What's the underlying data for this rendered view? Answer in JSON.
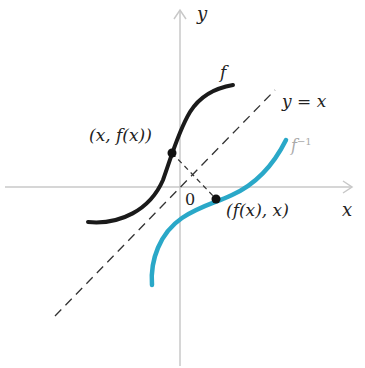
{
  "diagram": {
    "axes": {
      "x_label": "x",
      "y_label": "y",
      "origin_label": "0"
    },
    "curves": [
      {
        "name": "f",
        "label": "f",
        "color": "#1a1a1a"
      },
      {
        "name": "f-inverse",
        "label": "f⁻¹",
        "color": "#2aa8c8"
      },
      {
        "name": "line-y-equals-x",
        "label": "y = x",
        "style": "dashed",
        "color": "#333333"
      }
    ],
    "points": [
      {
        "label": "(x, f(x))",
        "on": "f"
      },
      {
        "label": "(f(x), x)",
        "on": "f-inverse"
      }
    ],
    "connector": "dashed segment joining (x, f(x)) and (f(x), x), perpendicular to y = x"
  },
  "labels": {
    "y_axis": "y",
    "x_axis": "x",
    "origin": "0",
    "f": "f",
    "f_inv_base": "f",
    "f_inv_sup": "−1",
    "line": "y = x",
    "point_f": "(x, f(x))",
    "point_finv": "(f(x), x)"
  }
}
